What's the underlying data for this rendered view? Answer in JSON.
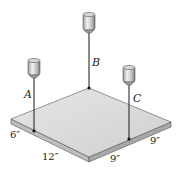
{
  "figure": {
    "cables": [
      {
        "label": "A"
      },
      {
        "label": "B"
      },
      {
        "label": "C"
      }
    ],
    "dimensions": [
      {
        "id": "left-edge-short",
        "text": "6″"
      },
      {
        "id": "left-edge-long",
        "text": "12″"
      },
      {
        "id": "front-edge-right",
        "text": "9″"
      },
      {
        "id": "right-edge",
        "text": "9″"
      }
    ],
    "colors": {
      "plate_top": "#d9d9d9",
      "plate_edge_left": "#bdbdbd",
      "plate_edge_right": "#a8a8a8",
      "cable": "#2a2a2a",
      "scale_body": "#c8c8c8"
    }
  }
}
